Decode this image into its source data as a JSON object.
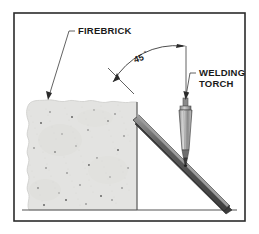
{
  "figure": {
    "border_color": "#2b2b2b",
    "background_color": "#ffffff"
  },
  "labels": {
    "firebrick": "FIREBRICK",
    "welding_torch_line1": "WELDING",
    "welding_torch_line2": "TORCH",
    "angle_value": "45",
    "angle_degree_symbol": "°"
  },
  "parts": {
    "firebrick": {
      "name": "firebrick",
      "fill": "#e3e3e1",
      "edge": "#c9c9c6",
      "speckle_color": "#6f6f6f",
      "speckle_count": 28
    },
    "workpiece": {
      "name": "workpiece-bar",
      "body_fill": "#4a4a4a",
      "top_fill": "#8c8c8c",
      "edge": "#2a2a2a",
      "angle_degrees": 45
    },
    "torch": {
      "name": "welding-torch",
      "body_light": "#d2d2d2",
      "body_mid": "#9a9a9a",
      "body_dark": "#6a6a6a",
      "tip_fill": "#3a3a3a",
      "outline": "#4a4a4a"
    },
    "ground_line": {
      "name": "ground-line",
      "color": "#555555"
    },
    "reference_wall": {
      "name": "reference-wall-line",
      "color": "#555555"
    }
  },
  "annotations": {
    "angle_arc": {
      "name": "angle-dimension-arc",
      "color": "#3a3a3a",
      "value": 45
    },
    "leaders": {
      "firebrick_leader": "#3a3a3a",
      "torch_leader": "#3a3a3a"
    }
  },
  "speckles": [
    [
      41,
      123
    ],
    [
      62,
      134
    ],
    [
      88,
      130
    ],
    [
      108,
      121
    ],
    [
      124,
      136
    ],
    [
      34,
      148
    ],
    [
      55,
      152
    ],
    [
      76,
      146
    ],
    [
      97,
      158
    ],
    [
      118,
      150
    ],
    [
      46,
      168
    ],
    [
      67,
      173
    ],
    [
      89,
      165
    ],
    [
      110,
      177
    ],
    [
      128,
      168
    ],
    [
      38,
      188
    ],
    [
      59,
      193
    ],
    [
      80,
      185
    ],
    [
      101,
      196
    ],
    [
      122,
      188
    ],
    [
      50,
      112
    ],
    [
      72,
      117
    ],
    [
      94,
      110
    ],
    [
      115,
      114
    ],
    [
      44,
      205
    ],
    [
      86,
      204
    ],
    [
      112,
      200
    ],
    [
      66,
      200
    ]
  ]
}
